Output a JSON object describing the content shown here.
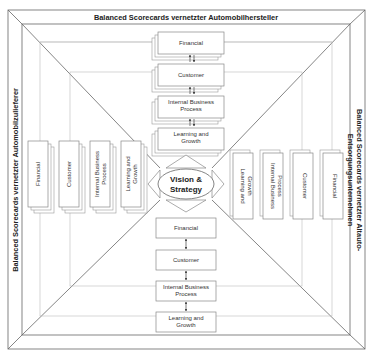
{
  "titles": {
    "top": "Balanced Scorecards vernetzter Automobilhersteller",
    "left": "Balanced Scorecards vernetzter Automobilzulieferer",
    "right_line1": "Balanced Scorecards vernetzter Altauto-",
    "right_line2": "Entsorgungsunternehmen"
  },
  "center": {
    "line1": "Vision &",
    "line2": "Strategy"
  },
  "perspectives": {
    "financial": "Financial",
    "customer": "Customer",
    "internal_1": "Internal Business",
    "internal_2": "Process",
    "learning_1": "Learning and",
    "learning_2": "Growth"
  },
  "colors": {
    "line": "#666666",
    "box_border": "#888888",
    "text": "#333333"
  }
}
